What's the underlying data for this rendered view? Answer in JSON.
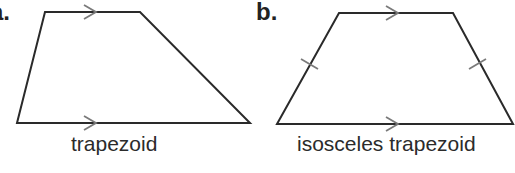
{
  "figures": [
    {
      "letter": "a.",
      "caption": "trapezoid",
      "vertices": [
        [
          45,
          12
        ],
        [
          140,
          12
        ],
        [
          250,
          123
        ],
        [
          17,
          123
        ]
      ],
      "markings": {
        "parallel_arrows": [
          "top",
          "bottom"
        ],
        "congruent_ticks": []
      }
    },
    {
      "letter": "b.",
      "caption": "isosceles trapezoid",
      "vertices": [
        [
          339,
          13
        ],
        [
          453,
          13
        ],
        [
          513,
          124
        ],
        [
          277,
          124
        ]
      ],
      "markings": {
        "parallel_arrows": [
          "top",
          "bottom"
        ],
        "congruent_ticks": [
          "left",
          "right"
        ]
      }
    }
  ],
  "colors": {
    "stroke": "#2a2a2a",
    "marker": "#7a7a7a",
    "text": "#2b2b2b"
  }
}
